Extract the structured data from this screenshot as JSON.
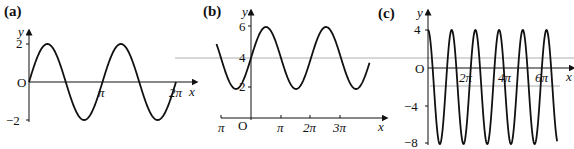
{
  "chart_data": [
    {
      "type": "line",
      "panel": "(a)",
      "title": "(a)",
      "xlabel": "x",
      "ylabel": "y",
      "origin_label": "O",
      "x_ticks": [
        "π",
        "2π"
      ],
      "y_ticks": [
        "2",
        "−2"
      ],
      "function": "y = 2 sin(2x)",
      "x_range": [
        0,
        "2π"
      ],
      "ylim": [
        -2,
        2
      ],
      "x": [
        0,
        0.785,
        1.571,
        2.356,
        3.142,
        3.927,
        4.712,
        5.498,
        6.283
      ],
      "values": [
        0,
        2,
        0,
        -2,
        0,
        2,
        0,
        -2,
        0
      ]
    },
    {
      "type": "line",
      "panel": "(b)",
      "title": "(b)",
      "xlabel": "x",
      "ylabel": "y",
      "origin_label": "O",
      "x_ticks": [
        "−π",
        "π",
        "2π",
        "3π"
      ],
      "x_tick_labels_shown": [
        "π",
        "π",
        "2π",
        "3π"
      ],
      "y_ticks": [
        "6",
        "4",
        "2"
      ],
      "function": "y = 4 + 2 sin(x)",
      "x_range": [
        "-π",
        "3.8π"
      ],
      "ylim": [
        2,
        6
      ],
      "x": [
        -3.142,
        -1.571,
        0,
        1.571,
        3.142,
        4.712,
        6.283,
        7.854,
        9.425,
        11.0
      ],
      "values": [
        4,
        2,
        4,
        6,
        4,
        2,
        4,
        6,
        4,
        2.1
      ]
    },
    {
      "type": "line",
      "panel": "(c)",
      "title": "(c)",
      "xlabel": "x",
      "ylabel": "y",
      "origin_label": "O",
      "x_ticks": [
        "2π",
        "4π",
        "6π"
      ],
      "y_ticks": [
        "4",
        "−4",
        "−8"
      ],
      "function": "y = −2 + 6 cos(kx), 6 peaks visible",
      "ylim": [
        -8,
        4
      ],
      "peaks_y": 4,
      "troughs_y": -8
    }
  ],
  "labels": {
    "a": {
      "panel": "(a)",
      "y": "y",
      "x": "x",
      "o": "O",
      "y_top": "2",
      "y_bot": "−2",
      "x1": "π",
      "x2": "2π"
    },
    "b": {
      "panel": "(b)",
      "y": "y",
      "x": "x",
      "o": "O",
      "y6": "6",
      "y4": "4",
      "y2": "2",
      "xm": "π",
      "x1": "π",
      "x2": "2π",
      "x3": "3π"
    },
    "c": {
      "panel": "(c)",
      "y": "y",
      "x": "x",
      "o": "O",
      "y4": "4",
      "ym4": "−4",
      "ym8": "−8",
      "x2": "2π",
      "x4": "4π",
      "x6": "6π"
    }
  }
}
